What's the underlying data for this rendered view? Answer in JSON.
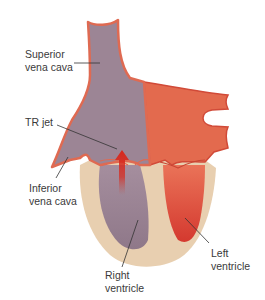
{
  "diagram": {
    "type": "anatomical illustration",
    "labels": {
      "superior_vena_cava": [
        "Superior",
        "vena cava"
      ],
      "tr_jet": [
        "TR jet"
      ],
      "inferior_vena_cava": [
        "Inferior",
        "vena cava"
      ],
      "right_ventricle": [
        "Right",
        "ventricle"
      ],
      "left_ventricle": [
        "Left",
        "ventricle"
      ]
    },
    "colors": {
      "venous_chamber": "#9c8595",
      "venous_chamber_light": "#b59eae",
      "arterial_chamber": "#e36a4e",
      "arterial_chamber_dark": "#d9483a",
      "vessel_wall": "#df6a52",
      "myocardium": "#e8cfb0",
      "jet": "#d8281c",
      "leader_line": "#333333",
      "label_text": "#3a3a3a"
    }
  }
}
